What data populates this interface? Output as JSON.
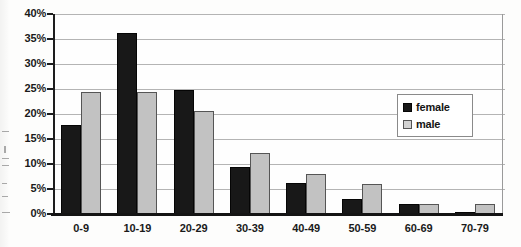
{
  "chart_data": {
    "type": "bar",
    "title": "",
    "xlabel": "",
    "ylabel": "",
    "categories": [
      "0-9",
      "10-19",
      "20-29",
      "30-39",
      "40-49",
      "50-59",
      "60-69",
      "70-79"
    ],
    "series": [
      {
        "name": "female",
        "color": "#181818",
        "values": [
          17.9,
          36.3,
          24.8,
          9.5,
          6.3,
          3.0,
          2.0,
          0.4
        ]
      },
      {
        "name": "male",
        "color": "#c2c2c2",
        "values": [
          24.5,
          24.5,
          20.7,
          12.3,
          8.0,
          6.1,
          2.1,
          2.1
        ]
      }
    ],
    "ylim": [
      0,
      40
    ],
    "ytick_step": 5,
    "ytick_labels": [
      "40%",
      "35%",
      "30%",
      "25%",
      "20%",
      "15%",
      "10%",
      "5%",
      "0%"
    ],
    "ytick_values": [
      40,
      35,
      30,
      25,
      20,
      15,
      10,
      5,
      0
    ],
    "grid": true,
    "grid_axis": "y",
    "legend_position": "upper-right-inside",
    "legend_entries": [
      "female",
      "male"
    ]
  },
  "legend": {
    "female_label": "female",
    "male_label": "male"
  }
}
